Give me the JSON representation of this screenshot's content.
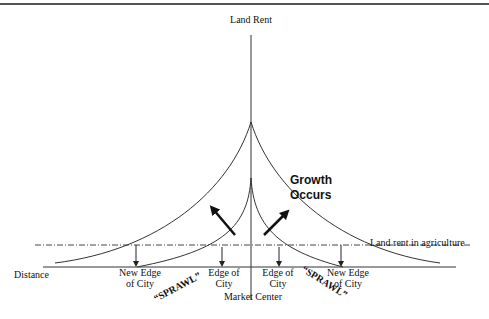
{
  "diagram": {
    "y_axis_label": "Land Rent",
    "x_axis_label": "Distance",
    "growth_label_line1": "Growth",
    "growth_label_line2": "Occurs",
    "agriculture_label": "Land rent in agriculture",
    "market_center_label": "Market Center",
    "left_new_edge": {
      "line1": "New Edge",
      "line2": "of City"
    },
    "left_edge": {
      "line1": "Edge of",
      "line2": "City"
    },
    "right_edge": {
      "line1": "Edge of",
      "line2": "City"
    },
    "right_new_edge": {
      "line1": "New Edge",
      "line2": "of City"
    },
    "sprawl_left": "“SPRAWL”",
    "sprawl_right": "“SPRAWL”"
  },
  "colors": {
    "line": "#333333",
    "text": "#111111",
    "top_rule": "#555555"
  }
}
